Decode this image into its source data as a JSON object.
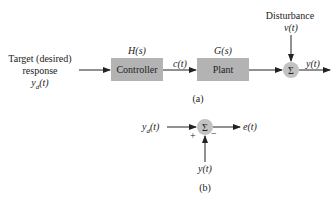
{
  "figure_a": {
    "input_label_lines": [
      "Target (desired)",
      "response",
      "y_d(t)"
    ],
    "input_label": {
      "line1": "Target (desired)",
      "line2": "response",
      "line3_main": "y",
      "line3_sub": "d",
      "line3_arg": "(t)"
    },
    "controller": {
      "transfer_function": "H(s)",
      "label": "Controller"
    },
    "controller_output": "c(t)",
    "plant": {
      "transfer_function": "G(s)",
      "label": "Plant"
    },
    "disturbance": {
      "label": "Disturbance",
      "signal": "ν(t)"
    },
    "summing_junction": "Σ",
    "output": "y(t)",
    "caption": "(a)"
  },
  "figure_b": {
    "input": {
      "main": "y",
      "sub": "d",
      "arg": "(t)"
    },
    "summing_junction": "Σ",
    "plus_sign": "+",
    "minus_sign": "−",
    "feedback": "y(t)",
    "output": "e(t)",
    "caption": "(b)"
  },
  "colors": {
    "block_fill": "#b3b3b3",
    "sum_fill": "#c2c2c2",
    "line": "#222222"
  }
}
